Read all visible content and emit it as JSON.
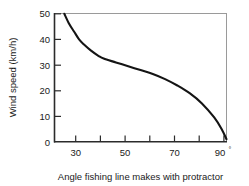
{
  "chart_data": {
    "type": "line",
    "title": "",
    "xlabel": "Angle fishing line makes with protractor",
    "ylabel": "Wind speed (km/h)",
    "xlim": [
      20,
      90
    ],
    "ylim": [
      0,
      50
    ],
    "grid": false,
    "legend": null,
    "x_tick_labels": [
      "30",
      "50",
      "70",
      "90"
    ],
    "x_tick_values": [
      30,
      50,
      70,
      90
    ],
    "x_minor_tick_values": [
      20,
      40,
      60,
      80
    ],
    "x_last_tick_suffix": "°",
    "y_tick_labels": [
      "0",
      "10",
      "20",
      "30",
      "40",
      "50"
    ],
    "y_tick_values": [
      0,
      10,
      20,
      30,
      40,
      50
    ],
    "series": [
      {
        "name": "wind speed vs angle",
        "x": [
          24,
          26,
          28,
          30,
          32,
          35,
          38,
          40,
          45,
          50,
          55,
          60,
          65,
          70,
          75,
          80,
          85,
          88,
          90
        ],
        "values": [
          50,
          46,
          43,
          40,
          38,
          35.5,
          33.5,
          32.5,
          31,
          29.5,
          28,
          26.5,
          24.5,
          22,
          19,
          15,
          9.5,
          5,
          1
        ]
      }
    ],
    "line_color": "#141414",
    "line_width": 2.1,
    "frame_color_dark": "#2b2b2b",
    "frame_color_light": "#9a9a9a",
    "background": "#ffffff"
  }
}
